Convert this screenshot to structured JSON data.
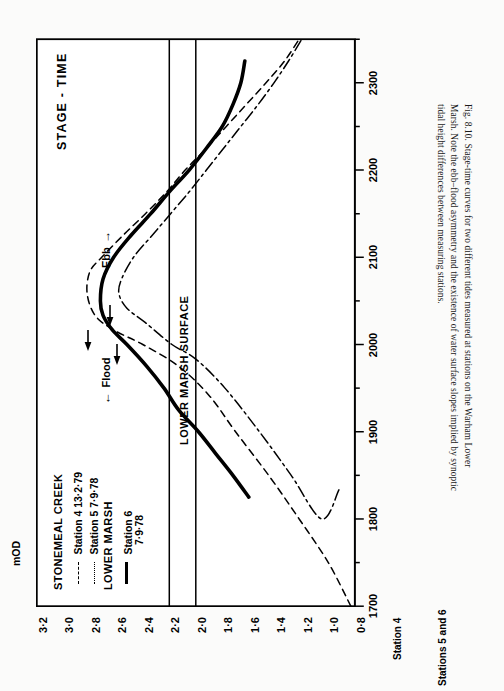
{
  "figure": {
    "title": "STAGE - TIME",
    "caption": "Fig. 8.10.  Stage-time curves for two different tides measured at stations on the Warham Lower Marsh. Note the ebb–flood asymmetry and the existence of water surface slopes implied by synoptic tidal height differences between measuring stations.",
    "caption_lines": [
      "Fig. 8.10.  Stage-time curves for two different tides measured at stations on the Warham Lower",
      "Marsh. Note the ebb–flood asymmetry and the existence of water surface slopes implied by synoptic",
      "tidal height differences between measuring stations."
    ]
  },
  "legend": {
    "group1_title": "STONEMEAL CREEK",
    "group2_title": "LOWER MARSH",
    "entries": [
      {
        "style": "dashed",
        "label": "Station 4  13·2·79",
        "sample": "– – –"
      },
      {
        "style": "dashdot",
        "label": "Station 5   7·9·78",
        "sample": "– · – ·"
      },
      {
        "style": "solid",
        "label": "Station 6",
        "label2": "7·9·78",
        "sample": "——"
      }
    ]
  },
  "annotations": {
    "marsh_surface": "LOWER MARSH SURFACE",
    "flood": "Flood",
    "ebb": "Ebb",
    "flood_arrow": "←",
    "ebb_arrow": "→"
  },
  "axes": {
    "value_axis_label": "mOD",
    "value_ticks": [
      "3·2",
      "3·0",
      "2·8",
      "2·6",
      "2·4",
      "2·2",
      "2·0",
      "1·8",
      "1·6",
      "1·4",
      "1·2",
      "1·0",
      "0·8"
    ],
    "value_min": 0.8,
    "value_max": 3.2,
    "time_axis_1_label": "Station 4",
    "time_axis_1_ticks": [
      "1700",
      "1800",
      "1900",
      "2000",
      "2100",
      "2200",
      "2300"
    ],
    "time_axis_2_label": "Stations 5 and 6",
    "time_axis_2_ticks": [
      "0700",
      "0800",
      "0900",
      "1000",
      "1100",
      "1200",
      "1300"
    ]
  },
  "chart_data": {
    "type": "line",
    "title": "STAGE - TIME",
    "xlabel": "Station 4 / Stations 5 and 6  (time, h)",
    "ylabel": "mOD",
    "xlim": [
      1700,
      2330
    ],
    "ylim": [
      0.8,
      3.2
    ],
    "grid": false,
    "legend_position": "upper-left-inside",
    "reference_lines": [
      {
        "name": "LOWER MARSH SURFACE",
        "value": 2.2,
        "orientation": "horizontal"
      },
      {
        "name": "LOWER MARSH SURFACE",
        "value": 2.0,
        "orientation": "horizontal"
      }
    ],
    "annotations": [
      {
        "text": "Flood",
        "arrow": "left"
      },
      {
        "text": "Ebb",
        "arrow": "right"
      }
    ],
    "series": [
      {
        "name": "Station 4  13·2·79",
        "style": "dashed",
        "points": [
          [
            1700,
            0.83
          ],
          [
            1730,
            1.0
          ],
          [
            1800,
            1.22
          ],
          [
            1830,
            1.45
          ],
          [
            1900,
            1.7
          ],
          [
            1925,
            1.9
          ],
          [
            1945,
            2.13
          ],
          [
            2000,
            2.4
          ],
          [
            2010,
            2.62
          ],
          [
            2020,
            2.76
          ],
          [
            2035,
            2.82
          ],
          [
            2050,
            2.8
          ],
          [
            2100,
            2.71
          ],
          [
            2115,
            2.55
          ],
          [
            2130,
            2.38
          ],
          [
            2145,
            2.22
          ],
          [
            2200,
            2.08
          ],
          [
            2215,
            1.92
          ],
          [
            2230,
            1.77
          ],
          [
            2245,
            1.62
          ],
          [
            2300,
            1.47
          ],
          [
            2315,
            1.33
          ],
          [
            2330,
            1.22
          ]
        ]
      },
      {
        "name": "Station 5   7·9·78",
        "style": "dashdot",
        "points": [
          [
            1780,
            0.92
          ],
          [
            1800,
            1.05
          ],
          [
            1830,
            1.28
          ],
          [
            1900,
            1.52
          ],
          [
            1930,
            1.78
          ],
          [
            1950,
            2.0
          ],
          [
            2000,
            2.18
          ],
          [
            2015,
            2.38
          ],
          [
            2025,
            2.52
          ],
          [
            2035,
            2.58
          ],
          [
            2045,
            2.56
          ],
          [
            2100,
            2.47
          ],
          [
            2115,
            2.33
          ],
          [
            2130,
            2.19
          ],
          [
            2145,
            2.05
          ],
          [
            2200,
            1.92
          ],
          [
            2215,
            1.79
          ],
          [
            2230,
            1.66
          ],
          [
            2245,
            1.53
          ],
          [
            2300,
            1.41
          ],
          [
            2315,
            1.3
          ],
          [
            2330,
            1.2
          ]
        ]
      },
      {
        "name": "Station 6   7·9·78",
        "style": "solid",
        "points": [
          [
            1815,
            1.6
          ],
          [
            1830,
            1.72
          ],
          [
            1845,
            1.85
          ],
          [
            1900,
            1.98
          ],
          [
            1915,
            2.13
          ],
          [
            1930,
            2.24
          ],
          [
            1945,
            2.37
          ],
          [
            2000,
            2.52
          ],
          [
            2010,
            2.63
          ],
          [
            2020,
            2.7
          ],
          [
            2030,
            2.72
          ],
          [
            2045,
            2.7
          ],
          [
            2100,
            2.62
          ],
          [
            2115,
            2.49
          ],
          [
            2130,
            2.34
          ],
          [
            2145,
            2.2
          ],
          [
            2200,
            2.05
          ],
          [
            2215,
            1.92
          ],
          [
            2230,
            1.8
          ],
          [
            2245,
            1.72
          ],
          [
            2300,
            1.66
          ],
          [
            2315,
            1.63
          ]
        ]
      }
    ]
  }
}
